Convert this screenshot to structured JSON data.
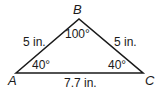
{
  "diagram": {
    "type": "triangle",
    "colors": {
      "stroke": "#1a1a1a",
      "text": "#1a1a1a",
      "background": "#ffffff"
    },
    "vertices": [
      {
        "name": "A",
        "x": 16,
        "y": 73
      },
      {
        "name": "B",
        "x": 79,
        "y": 19
      },
      {
        "name": "C",
        "x": 143,
        "y": 73
      }
    ],
    "vertex_labels": {
      "A": "A",
      "B": "B",
      "C": "C"
    },
    "sides": {
      "AB": "5 in.",
      "BC": "5 in.",
      "AC": "7.7 in."
    },
    "angles": {
      "A": "40°",
      "B": "100°",
      "C": "40°"
    }
  }
}
